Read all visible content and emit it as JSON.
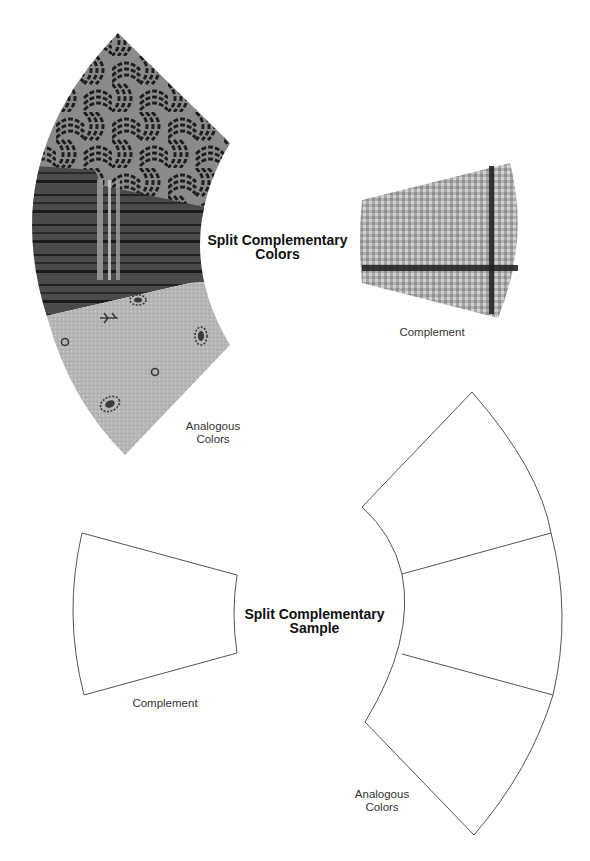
{
  "top_diagram": {
    "title_line1": "Split Complementary",
    "title_line2": "Colors",
    "analogous_line1": "Analogous",
    "analogous_line2": "Colors",
    "complement_label": "Complement",
    "swatches": [
      {
        "name": "swirl-print-fabric",
        "pattern": "woven basket swirl",
        "tone": "dark gray / mid gray"
      },
      {
        "name": "plaid-fabric",
        "pattern": "dark plaid with light vertical stripes",
        "tone": "dark gray"
      },
      {
        "name": "floral-print-fabric",
        "pattern": "leaf sprigs and small circles",
        "tone": "light gray"
      },
      {
        "name": "gingham-fabric",
        "pattern": "light check with dark cross stripe",
        "tone": "light gray"
      }
    ]
  },
  "bottom_diagram": {
    "title_line1": "Split Complementary",
    "title_line2": "Sample",
    "analogous_line1": "Analogous",
    "analogous_line2": "Colors",
    "complement_label": "Complement"
  },
  "colors": {
    "outline": "#555555",
    "swirl_dark": "#2a2a2a",
    "swirl_light": "#8c8c8c",
    "plaid": "#444444",
    "floral": "#b4b4b4",
    "gingham": "#b8b8b8"
  }
}
